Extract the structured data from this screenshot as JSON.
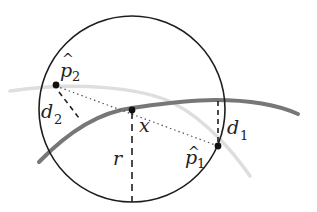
{
  "diagram": {
    "type": "geometry-illustration",
    "colors": {
      "circle": "#1e1e1e",
      "main_curve": "#7a7a7a",
      "secondary_curve": "#dcdcdc",
      "points": "#111111",
      "dashed_lines": "#1e1e1e",
      "dotted_line": "#555555"
    },
    "labels": {
      "p2": {
        "base": "p",
        "hat": "^",
        "sub": "2"
      },
      "p1": {
        "base": "p",
        "hat": "^",
        "sub": "1"
      },
      "d2": {
        "base": "d",
        "sub": "2"
      },
      "d1": {
        "base": "d",
        "sub": "1"
      },
      "x": "x",
      "r": "r"
    },
    "elements": [
      "circle",
      "main-curve",
      "secondary-curve",
      "point-x",
      "point-p1",
      "point-p2",
      "dotted-chord-p2-p1",
      "dashed-radius-r",
      "dashed-distance-d1",
      "dashed-distance-d2"
    ]
  }
}
